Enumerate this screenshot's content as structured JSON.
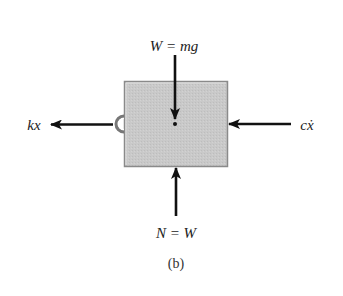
{
  "diagram": {
    "type": "free-body-diagram",
    "caption": "(b)",
    "body": {
      "shape": "rectangle",
      "fill": "#c9c9c9",
      "stroke": "#888888"
    },
    "forces": [
      {
        "id": "weight",
        "label": "W = mg",
        "direction": "down",
        "applied_at": "center"
      },
      {
        "id": "spring",
        "label": "kx",
        "direction": "left",
        "applied_at": "left-side-hook"
      },
      {
        "id": "damper",
        "label": "cẋ",
        "direction": "left",
        "applied_at": "right-side"
      },
      {
        "id": "normal",
        "label": "N = W",
        "direction": "up",
        "applied_at": "bottom"
      }
    ],
    "colors": {
      "arrow": "#111111",
      "text": "#222222"
    }
  }
}
